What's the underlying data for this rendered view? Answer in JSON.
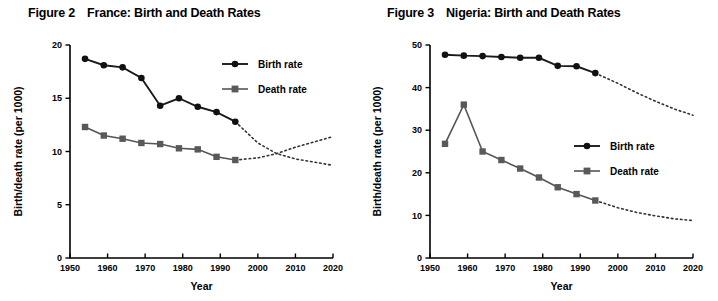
{
  "page": {
    "background": "#ffffff",
    "width": 718,
    "height": 301
  },
  "figures": [
    {
      "id": "france",
      "number": "Figure 2",
      "title": "France: Birth and Death Rates",
      "chart_data": {
        "type": "line",
        "title": "France: Birth and Death Rates",
        "xlabel": "Year",
        "ylabel": "Birth/death rate (per 1000)",
        "xlim": [
          1950,
          2020
        ],
        "ylim": [
          0,
          20
        ],
        "xticks": [
          1950,
          1960,
          1970,
          1980,
          1990,
          2000,
          2010,
          2020
        ],
        "yticks": [
          0,
          5,
          10,
          15,
          20
        ],
        "grid": false,
        "legend_position": "top-right",
        "series": [
          {
            "name": "Birth rate",
            "marker": "circle",
            "color": "#111111",
            "x": [
              1954,
              1959,
              1964,
              1969,
              1974,
              1979,
              1984,
              1989,
              1994
            ],
            "values": [
              18.7,
              18.1,
              17.9,
              16.9,
              14.3,
              15.0,
              14.2,
              13.7,
              12.8
            ],
            "projection": {
              "style": "dotted",
              "x": [
                1994,
                2000,
                2005,
                2010,
                2015,
                2020
              ],
              "values": [
                12.8,
                10.8,
                9.8,
                9.3,
                9.0,
                8.7
              ]
            }
          },
          {
            "name": "Death rate",
            "marker": "square",
            "color": "#595959",
            "x": [
              1954,
              1959,
              1964,
              1969,
              1974,
              1979,
              1984,
              1989,
              1994
            ],
            "values": [
              12.3,
              11.5,
              11.2,
              10.8,
              10.7,
              10.3,
              10.2,
              9.5,
              9.2
            ],
            "projection": {
              "style": "dotted",
              "x": [
                1994,
                2000,
                2005,
                2010,
                2015,
                2020
              ],
              "values": [
                9.2,
                9.4,
                9.8,
                10.4,
                10.9,
                11.4
              ]
            }
          }
        ]
      },
      "legend": [
        {
          "label": "Birth rate",
          "marker": "circle"
        },
        {
          "label": "Death rate",
          "marker": "square"
        }
      ]
    },
    {
      "id": "nigeria",
      "number": "Figure 3",
      "title": "Nigeria: Birth and Death Rates",
      "chart_data": {
        "type": "line",
        "title": "Nigeria: Birth and Death Rates",
        "xlabel": "Year",
        "ylabel": "Birth/death rate (per 1000)",
        "xlim": [
          1950,
          2020
        ],
        "ylim": [
          0,
          50
        ],
        "xticks": [
          1950,
          1960,
          1970,
          1980,
          1990,
          2000,
          2010,
          2020
        ],
        "yticks": [
          0,
          10,
          20,
          30,
          40,
          50
        ],
        "grid": false,
        "legend_position": "right-middle",
        "series": [
          {
            "name": "Birth rate",
            "marker": "circle",
            "color": "#111111",
            "x": [
              1954,
              1959,
              1964,
              1969,
              1974,
              1979,
              1984,
              1989,
              1994
            ],
            "values": [
              47.7,
              47.5,
              47.4,
              47.2,
              47.0,
              47.0,
              45.1,
              45.0,
              43.4
            ],
            "projection": {
              "style": "dotted",
              "x": [
                1994,
                2000,
                2005,
                2010,
                2015,
                2020
              ],
              "values": [
                43.4,
                41.0,
                38.8,
                36.8,
                35.0,
                33.5
              ]
            }
          },
          {
            "name": "Death rate",
            "marker": "square",
            "color": "#595959",
            "x": [
              1954,
              1959,
              1964,
              1969,
              1974,
              1979,
              1984,
              1989,
              1994
            ],
            "values": [
              26.8,
              36.0,
              25.0,
              23.0,
              21.0,
              18.9,
              16.6,
              15.0,
              13.5
            ],
            "projection": {
              "style": "dotted",
              "x": [
                1994,
                2000,
                2005,
                2010,
                2015,
                2020
              ],
              "values": [
                13.5,
                11.8,
                10.7,
                9.9,
                9.2,
                8.8
              ]
            }
          }
        ]
      },
      "legend": [
        {
          "label": "Birth rate",
          "marker": "circle"
        },
        {
          "label": "Death rate",
          "marker": "square"
        }
      ]
    }
  ]
}
